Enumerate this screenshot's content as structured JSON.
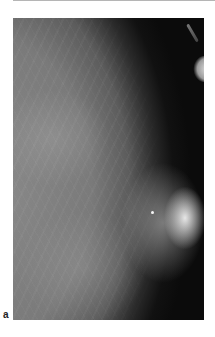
{
  "figure": {
    "panel_label": "a",
    "image_description": "Mammogram (breast X-ray) showing fibroglandular tissue with dense bright region near right edge",
    "colors": {
      "background": "#ffffff",
      "image_dark": "#0b0b0b",
      "tissue_gray": "#8a8a8a",
      "bright_region": "#f0f0f0",
      "label": "#222222",
      "top_rule": "#b5b5b5"
    }
  }
}
